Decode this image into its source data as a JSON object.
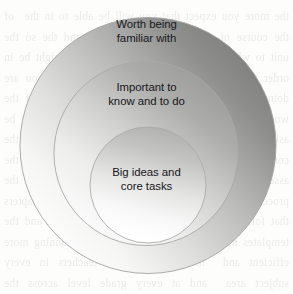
{
  "diagram": {
    "kind": "concentric-circles",
    "background_color": "#fdfdfc",
    "text_color": "#17171b",
    "outline_color": "#9a9a9a",
    "rings": [
      {
        "id": "outer",
        "level": 1,
        "label": "Worth being\nfamiliar with",
        "fill_light": "#fdfdfd",
        "fill_dark": "#80807f"
      },
      {
        "id": "middle",
        "level": 2,
        "label": "Important to\nknow and to do",
        "fill_light": "#fcfcfc",
        "fill_dark": "#9e9e9d"
      },
      {
        "id": "inner",
        "level": 3,
        "label": "Big ideas and\ncore tasks",
        "fill_light": "#ffffff",
        "fill_dark": "#b5b5b4"
      }
    ]
  },
  "background_bleed": {
    "note": "faint mirrored show-through ink from the reverse side of the scanned page",
    "text": "the more you expect that you will be able to in the  of the course of study and then the goal and the so the unit to what is worth the time and so we  might be in order to make the plan and in the  of what you are doing and what matters in the end  the design of the work and the ways in which the  students will be asked to show what they know and  can do with the content that has been taught in  class and the assessment of that learning is the  next step in the process that we have outlined  here and in the chapters that follow we will look  at the specific tools and the templates that can  be used to make the planning more efficient and  more effective for teachers in every subject area  and at every grade level across the curriculum as  a whole and the school improvement plan as well"
  }
}
